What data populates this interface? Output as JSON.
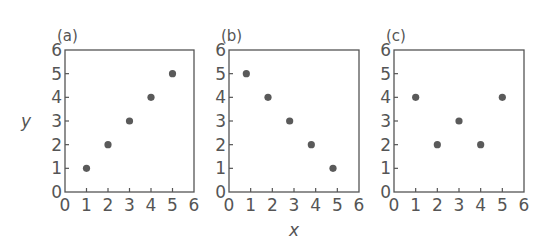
{
  "chart_data": [
    {
      "type": "scatter",
      "title": "(a)",
      "xlabel": "",
      "ylabel": "y",
      "xlim": [
        0,
        6
      ],
      "ylim": [
        0,
        6
      ],
      "xticks": [
        "0",
        "1",
        "2",
        "3",
        "4",
        "5",
        "6"
      ],
      "yticks": [
        "0",
        "1",
        "2",
        "3",
        "4",
        "5",
        "6"
      ],
      "points": [
        [
          1,
          1
        ],
        [
          2,
          2
        ],
        [
          3,
          3
        ],
        [
          4,
          4
        ],
        [
          5,
          5
        ]
      ],
      "grid": false,
      "marker_color": "#5a5a5a"
    },
    {
      "type": "scatter",
      "title": "(b)",
      "xlabel": "x",
      "ylabel": "",
      "xlim": [
        0,
        6
      ],
      "ylim": [
        0,
        6
      ],
      "xticks": [
        "0",
        "1",
        "2",
        "3",
        "4",
        "5",
        "6"
      ],
      "yticks": [
        "0",
        "1",
        "2",
        "3",
        "4",
        "5",
        "6"
      ],
      "points": [
        [
          0.8,
          5
        ],
        [
          1.8,
          4
        ],
        [
          2.8,
          3
        ],
        [
          3.8,
          2
        ],
        [
          4.8,
          1
        ]
      ],
      "grid": false,
      "marker_color": "#5a5a5a"
    },
    {
      "type": "scatter",
      "title": "(c)",
      "xlabel": "",
      "ylabel": "",
      "xlim": [
        0,
        6
      ],
      "ylim": [
        0,
        6
      ],
      "xticks": [
        "0",
        "1",
        "2",
        "3",
        "4",
        "5",
        "6"
      ],
      "yticks": [
        "0",
        "1",
        "2",
        "3",
        "4",
        "5",
        "6"
      ],
      "points": [
        [
          1,
          4
        ],
        [
          2,
          2
        ],
        [
          3,
          3
        ],
        [
          4,
          2
        ],
        [
          5,
          4
        ]
      ],
      "grid": false,
      "marker_color": "#5a5a5a"
    }
  ],
  "layout": {
    "panels": [
      {
        "left": 65,
        "top": 50,
        "width": 129,
        "height": 142
      },
      {
        "left": 229,
        "top": 50,
        "width": 130,
        "height": 142
      },
      {
        "left": 394,
        "top": 50,
        "width": 130,
        "height": 142
      }
    ]
  }
}
